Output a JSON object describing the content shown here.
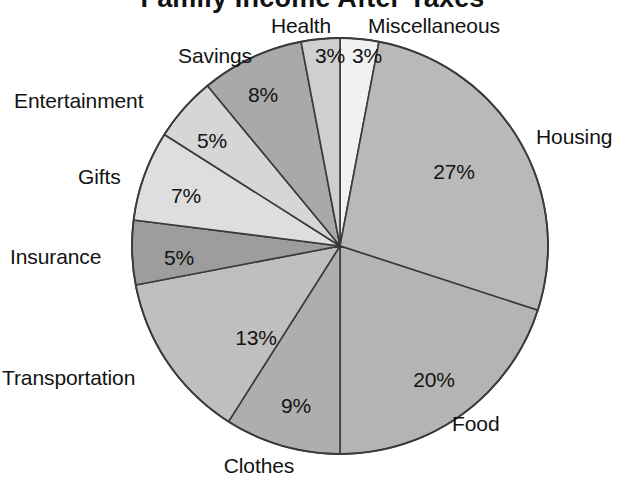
{
  "chart_data": {
    "type": "pie",
    "title": "Family Income After Taxes",
    "xlabel": "",
    "ylabel": "",
    "legend_position": "outside-labels",
    "grid": false,
    "units": "percent",
    "start_angle_deg": 0,
    "direction": "clockwise",
    "categories": [
      "Miscellaneous",
      "Housing",
      "Food",
      "Clothes",
      "Transportation",
      "Insurance",
      "Gifts",
      "Entertainment",
      "Savings",
      "Health"
    ],
    "values": [
      3,
      27,
      20,
      9,
      13,
      5,
      7,
      5,
      8,
      3
    ],
    "value_labels": [
      "3%",
      "27%",
      "20%",
      "9%",
      "13%",
      "5%",
      "7%",
      "5%",
      "8%",
      "3%"
    ],
    "slice_colors": [
      "#f1f1f1",
      "#b9b9b9",
      "#b4b4b4",
      "#aeaeae",
      "#bfbfbf",
      "#9d9d9d",
      "#dedede",
      "#d6d6d6",
      "#a9a9a9",
      "#cfcfcf"
    ],
    "slices": [
      {
        "label": "Miscellaneous",
        "value": 3,
        "value_label": "3%",
        "color": "#f1f1f1"
      },
      {
        "label": "Housing",
        "value": 27,
        "value_label": "27%",
        "color": "#b9b9b9"
      },
      {
        "label": "Food",
        "value": 20,
        "value_label": "20%",
        "color": "#b4b4b4"
      },
      {
        "label": "Clothes",
        "value": 9,
        "value_label": "9%",
        "color": "#aeaeae"
      },
      {
        "label": "Transportation",
        "value": 13,
        "value_label": "13%",
        "color": "#bfbfbf"
      },
      {
        "label": "Insurance",
        "value": 5,
        "value_label": "5%",
        "color": "#9d9d9d"
      },
      {
        "label": "Gifts",
        "value": 7,
        "value_label": "7%",
        "color": "#dedede"
      },
      {
        "label": "Entertainment",
        "value": 5,
        "value_label": "5%",
        "color": "#d6d6d6"
      },
      {
        "label": "Savings",
        "value": 8,
        "value_label": "8%",
        "color": "#a9a9a9"
      },
      {
        "label": "Health",
        "value": 3,
        "value_label": "3%",
        "color": "#cfcfcf"
      }
    ],
    "total": 100,
    "outline_color": "#3a3a3a"
  },
  "labels": {
    "health": "Health",
    "miscellaneous": "Miscellaneous",
    "savings": "Savings",
    "entertainment": "Entertainment",
    "gifts": "Gifts",
    "insurance": "Insurance",
    "transportation": "Transportation",
    "clothes": "Clothes",
    "food": "Food",
    "housing": "Housing"
  },
  "values": {
    "health": "3%",
    "miscellaneous": "3%",
    "savings": "8%",
    "entertainment": "5%",
    "gifts": "7%",
    "insurance": "5%",
    "transportation": "13%",
    "clothes": "9%",
    "food": "20%",
    "housing": "27%"
  }
}
